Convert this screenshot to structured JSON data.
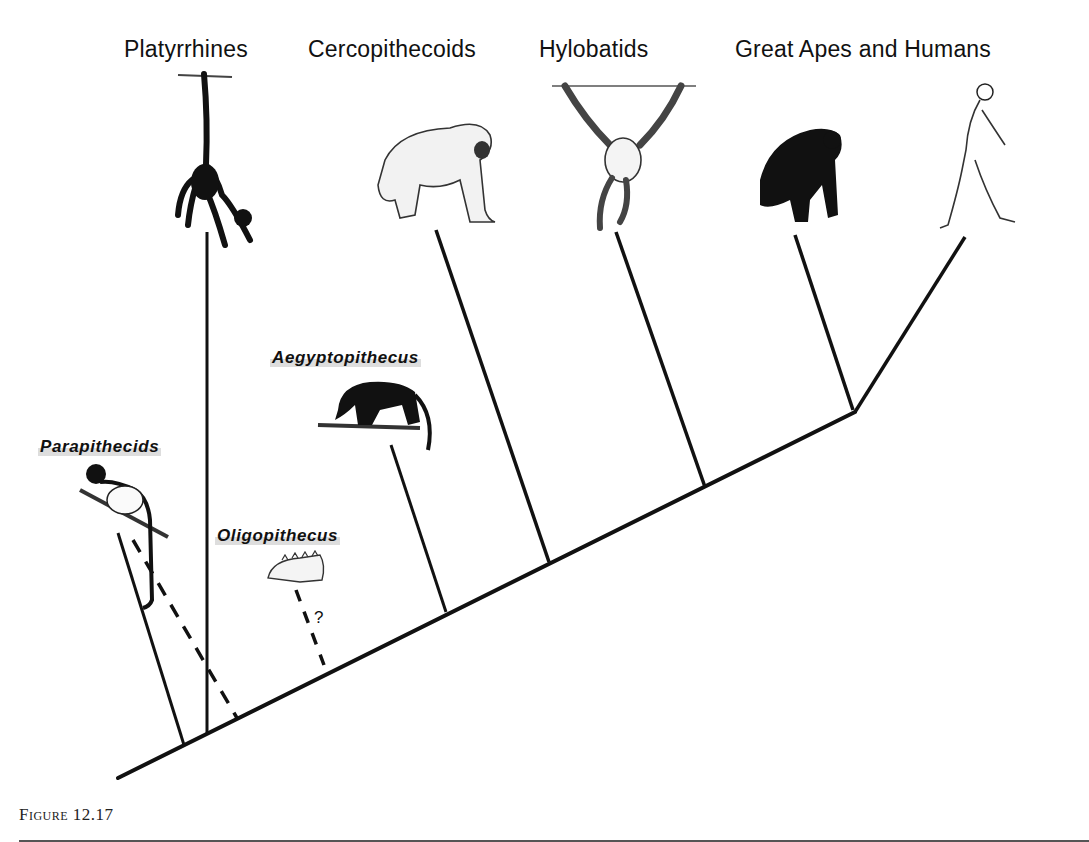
{
  "diagram": {
    "type": "phylogenetic-tree",
    "clades": [
      {
        "id": "platyrrhines",
        "label": "Platyrrhines",
        "illustration": "spider-monkey-hanging-by-tail"
      },
      {
        "id": "cercopithecoids",
        "label": "Cercopithecoids",
        "illustration": "baboon-walking"
      },
      {
        "id": "hylobatids",
        "label": "Hylobatids",
        "illustration": "gibbon-brachiating"
      },
      {
        "id": "great-apes-humans",
        "label": "Great Apes and Humans",
        "illustration": [
          "chimpanzee-knuckle-walking",
          "human-walking"
        ]
      }
    ],
    "fossil_taxa": [
      {
        "id": "parapithecids",
        "label": "Parapithecids",
        "illustration": "small-monkey-on-branch",
        "connection": "solid + dashed"
      },
      {
        "id": "oligopithecus",
        "label": "Oligopithecus",
        "illustration": "jaw-fragment",
        "connection": "dashed",
        "uncertainty_mark": "?"
      },
      {
        "id": "aegyptopithecus",
        "label": "Aegyptopithecus",
        "illustration": "quadrupedal-primate-on-branch",
        "connection": "solid"
      }
    ]
  },
  "caption": {
    "figure_label": "Figure 12.17"
  },
  "colors": {
    "line": "#111111",
    "background": "#ffffff",
    "label_highlight": "#b4b4b4"
  }
}
